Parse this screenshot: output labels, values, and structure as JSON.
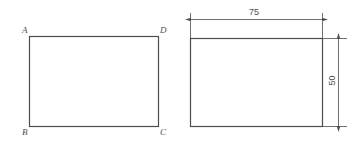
{
  "drawing": {
    "title": "Rectangle with vertex labels and dimensioned rectangle",
    "background_color": "#ffffff",
    "line_color": "#4d4d4d",
    "text_color": "#4d4d4d"
  },
  "left_figure": {
    "name": "labeled-rectangle",
    "vertices": {
      "top_left": "A",
      "top_right": "D",
      "bottom_left": "B",
      "bottom_right": "C"
    },
    "geometry": {
      "x": 29,
      "y": 36,
      "width": 129,
      "height": 90
    }
  },
  "right_figure": {
    "name": "dimensioned-rectangle",
    "geometry": {
      "x": 190,
      "y": 38,
      "width": 132,
      "height": 88
    },
    "dimensions": [
      {
        "id": "width-dimension",
        "value": "75",
        "orientation": "horizontal",
        "position": "above"
      },
      {
        "id": "height-dimension",
        "value": "50",
        "orientation": "vertical",
        "position": "right"
      }
    ]
  }
}
